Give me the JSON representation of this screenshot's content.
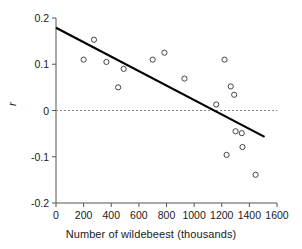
{
  "chart_data": {
    "type": "scatter",
    "title": "",
    "xlabel": "Number of wildebeest (thousands)",
    "ylabel": "r",
    "xlim": [
      0,
      1600
    ],
    "ylim": [
      -0.2,
      0.2
    ],
    "xticks": [
      0,
      200,
      400,
      600,
      800,
      1000,
      1200,
      1400,
      1600
    ],
    "xtick_labels": [
      "0",
      "200",
      "400",
      "600",
      "800",
      "1000",
      "1200",
      "1400",
      "1600"
    ],
    "yticks": [
      -0.2,
      -0.1,
      0,
      0.1,
      0.2
    ],
    "ytick_labels": [
      "-0.2",
      "-0.1",
      "0",
      "0.1",
      "0.2"
    ],
    "grid": false,
    "legend": "none",
    "marker": "open-circle",
    "marker_color": "#444444",
    "points": [
      {
        "x": 200,
        "y": 0.11
      },
      {
        "x": 275,
        "y": 0.153
      },
      {
        "x": 365,
        "y": 0.105
      },
      {
        "x": 450,
        "y": 0.05
      },
      {
        "x": 490,
        "y": 0.09
      },
      {
        "x": 700,
        "y": 0.11
      },
      {
        "x": 785,
        "y": 0.125
      },
      {
        "x": 930,
        "y": 0.069
      },
      {
        "x": 1160,
        "y": 0.013
      },
      {
        "x": 1220,
        "y": 0.11
      },
      {
        "x": 1235,
        "y": -0.096
      },
      {
        "x": 1265,
        "y": 0.052
      },
      {
        "x": 1290,
        "y": 0.034
      },
      {
        "x": 1300,
        "y": -0.045
      },
      {
        "x": 1345,
        "y": -0.049
      },
      {
        "x": 1350,
        "y": -0.079
      },
      {
        "x": 1445,
        "y": -0.139
      }
    ],
    "trend_line": {
      "name": "regression-line",
      "color": "#000000",
      "x0": 0,
      "y0": 0.179,
      "x1": 1510,
      "y1": -0.057
    },
    "reference_line": {
      "name": "zero-line",
      "style": "dashed",
      "color": "#888888",
      "y": 0
    },
    "annotations": []
  }
}
